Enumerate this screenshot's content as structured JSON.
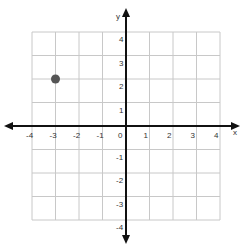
{
  "chart_data": {
    "type": "scatter",
    "title": "",
    "xlabel": "x",
    "ylabel": "y",
    "xlim": [
      -4,
      4
    ],
    "ylim": [
      -4,
      4
    ],
    "grid": true,
    "x_ticks": [
      "-4",
      "-3",
      "-2",
      "-1",
      "0",
      "1",
      "2",
      "3",
      "4"
    ],
    "y_ticks": [
      "-4",
      "-3",
      "-2",
      "-1",
      "1",
      "2",
      "3",
      "4"
    ],
    "points": [
      {
        "x": -3,
        "y": 2
      }
    ],
    "colors": {
      "grid": "#c8c8c8",
      "axis": "#111111",
      "point": "#555555"
    }
  },
  "labels": {
    "x_axis": "x",
    "y_axis": "y",
    "x_ticks": [
      "-4",
      "-3",
      "-2",
      "-1",
      "0",
      "1",
      "2",
      "3",
      "4"
    ],
    "y_pos": [
      "4",
      "3",
      "2",
      "1"
    ],
    "y_neg": [
      "-1",
      "-2",
      "-3",
      "-4"
    ]
  }
}
